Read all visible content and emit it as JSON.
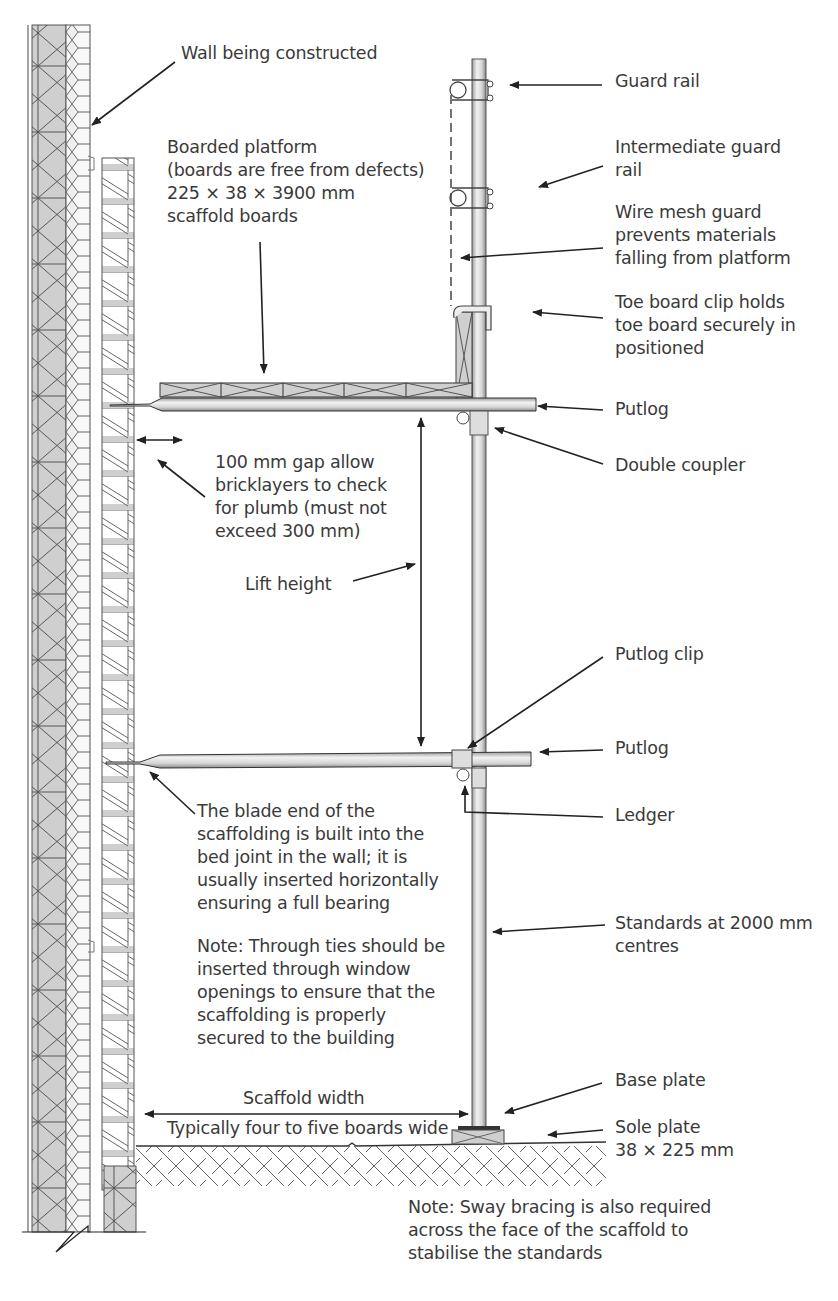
{
  "diagram": {
    "colors": {
      "line": "#333333",
      "fill_grey": "#d4d4d4",
      "block_grey": "#cfcfcf",
      "background": "#ffffff"
    }
  },
  "labels": {
    "wall": "Wall being constructed",
    "boarded_platform": "Boarded platform\n(boards are free from defects)\n225 × 38 × 3900 mm\nscaffold boards",
    "guard_rail": "Guard rail",
    "intermediate_guard_rail": "Intermediate guard\nrail",
    "wire_mesh": "Wire mesh guard\nprevents materials\nfalling from platform",
    "toe_board_clip": "Toe board clip holds\ntoe board securely in\npositioned",
    "putlog_upper": "Putlog",
    "double_coupler": "Double coupler",
    "gap": "100 mm gap allow\nbricklayers to check\nfor plumb (must not\nexceed 300 mm)",
    "lift_height": "Lift height",
    "putlog_clip": "Putlog clip",
    "putlog_lower": "Putlog",
    "ledger": "Ledger",
    "blade_end": "The blade end of the\nscaffolding is built into the\nbed joint in the wall; it is\nusually inserted horizontally\nensuring a full bearing",
    "through_ties_note": "Note: Through ties should be\ninserted through window\nopenings to ensure that the\nscaffolding is properly\nsecured to the building",
    "standards": "Standards at 2000 mm\ncentres",
    "scaffold_width": "Scaffold width",
    "scaffold_width_sub": "Typically four to five boards wide",
    "base_plate": "Base plate",
    "sole_plate": "Sole plate\n38 × 225 mm",
    "sway_bracing_note": "Note: Sway bracing is also required\nacross the face of the scaffold to\nstabilise the standards"
  }
}
